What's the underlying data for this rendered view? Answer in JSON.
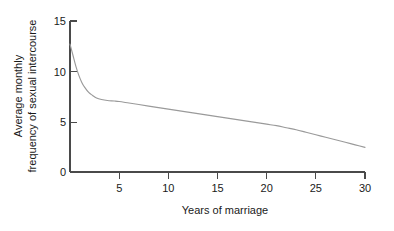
{
  "chart_data": {
    "type": "line",
    "title": "",
    "xlabel": "Years of marriage",
    "ylabel_line1": "Average monthly",
    "ylabel_line2": "frequency of sexual intercourse",
    "xlim": [
      0,
      30
    ],
    "ylim": [
      0,
      15
    ],
    "xticks": [
      5,
      10,
      15,
      20,
      25,
      30
    ],
    "xtick_labels": [
      "5",
      "10",
      "15",
      "20",
      "25",
      "30"
    ],
    "yticks": [
      0,
      5,
      10,
      15
    ],
    "ytick_labels": [
      "0",
      "5",
      "10",
      "15"
    ],
    "grid": false,
    "legend": false,
    "series": [
      {
        "name": "Average monthly frequency of sexual intercourse",
        "color": "#9a9a9a",
        "x": [
          0,
          0.3,
          0.6,
          0.9,
          1.2,
          1.5,
          1.9,
          2.3,
          2.7,
          3.2,
          3.8,
          4.5,
          5,
          6,
          7,
          8,
          9,
          10,
          11,
          12,
          13,
          14,
          15,
          16,
          17,
          18,
          19,
          20,
          21,
          22,
          23,
          24,
          25,
          26,
          27,
          28,
          29,
          30
        ],
        "y": [
          12.7,
          11.6,
          10.5,
          9.6,
          8.9,
          8.4,
          7.9,
          7.6,
          7.35,
          7.2,
          7.1,
          7.05,
          7.0,
          6.85,
          6.7,
          6.55,
          6.4,
          6.25,
          6.1,
          5.95,
          5.8,
          5.65,
          5.5,
          5.35,
          5.2,
          5.05,
          4.9,
          4.75,
          4.6,
          4.4,
          4.2,
          3.95,
          3.7,
          3.45,
          3.2,
          2.95,
          2.7,
          2.45
        ]
      }
    ]
  },
  "axes": {
    "tick_color": "#4a4a4a",
    "curve_color": "#9a9a9a"
  }
}
